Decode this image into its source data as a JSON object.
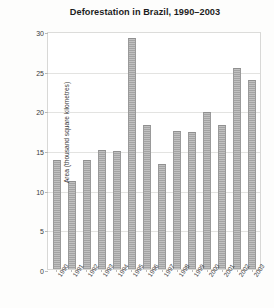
{
  "chart_data": {
    "type": "bar",
    "title": "Deforestation in Brazil, 1990–2003",
    "xlabel": "",
    "ylabel": "Area (thousand square kilometres)",
    "categories": [
      "1990",
      "1991",
      "1992",
      "1993",
      "1994",
      "1995",
      "1996",
      "1997",
      "1998",
      "1999",
      "2000",
      "2001",
      "2002",
      "2003"
    ],
    "values": [
      13.8,
      11.1,
      13.8,
      15.0,
      14.9,
      29.1,
      18.2,
      13.2,
      17.4,
      17.3,
      19.8,
      18.2,
      25.4,
      23.8
    ],
    "ylim": [
      0,
      30
    ],
    "y_ticks": [
      "0",
      "5",
      "10",
      "15",
      "20",
      "25",
      "30"
    ],
    "y_tick_values": [
      0,
      5,
      10,
      15,
      20,
      25,
      30
    ],
    "grid": true,
    "legend": null,
    "bar_color": "#a9a9a9",
    "axis_color": "#d8d8d6",
    "grid_color": "#e3e3e1",
    "text_color": "#2b2b2b"
  }
}
